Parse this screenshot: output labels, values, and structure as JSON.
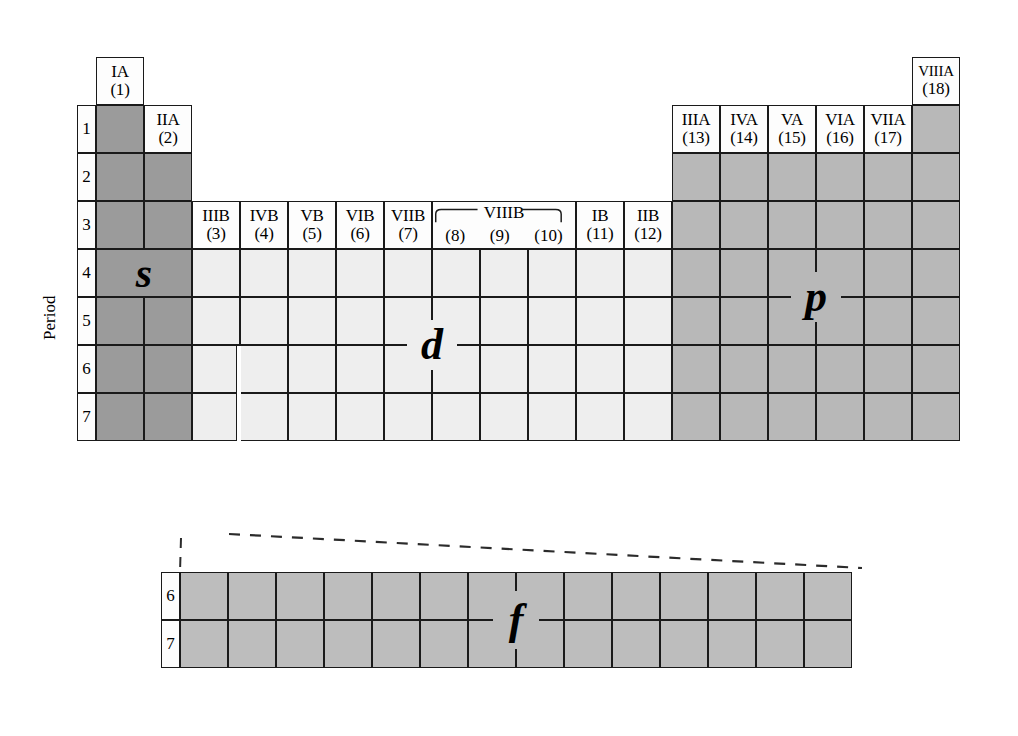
{
  "figure": {
    "kind": "periodic-table-block-diagram",
    "period_axis_label": "Period",
    "period_labels": [
      "1",
      "2",
      "3",
      "4",
      "5",
      "6",
      "7"
    ],
    "f_block_period_labels": [
      "6",
      "7"
    ],
    "block_letters": {
      "s": "s",
      "p": "p",
      "d": "d",
      "f": "f"
    },
    "colors": {
      "s_block": "#9b9b9b",
      "d_block": "#eeeeee",
      "p_block": "#b8b8b8",
      "f_block": "#bdbdbd",
      "header_box": "#fdfdfd",
      "line": "#1a1a1a"
    }
  },
  "group_headers": [
    {
      "roman": "IA",
      "arabic": "(1)",
      "col": 1
    },
    {
      "roman": "IIA",
      "arabic": "(2)",
      "col": 2
    },
    {
      "roman": "IIIB",
      "arabic": "(3)",
      "col": 3
    },
    {
      "roman": "IVB",
      "arabic": "(4)",
      "col": 4
    },
    {
      "roman": "VB",
      "arabic": "(5)",
      "col": 5
    },
    {
      "roman": "VIB",
      "arabic": "(6)",
      "col": 6
    },
    {
      "roman": "VIIB",
      "arabic": "(7)",
      "col": 7
    },
    {
      "roman": "IB",
      "arabic": "(11)",
      "col": 11
    },
    {
      "roman": "IIB",
      "arabic": "(12)",
      "col": 12
    },
    {
      "roman": "IIIA",
      "arabic": "(13)",
      "col": 13
    },
    {
      "roman": "IVA",
      "arabic": "(14)",
      "col": 14
    },
    {
      "roman": "VA",
      "arabic": "(15)",
      "col": 15
    },
    {
      "roman": "VIA",
      "arabic": "(16)",
      "col": 16
    },
    {
      "roman": "VIIA",
      "arabic": "(17)",
      "col": 17
    },
    {
      "roman": "VIIIA",
      "arabic": "(18)",
      "col": 18
    }
  ],
  "group_header_span": {
    "roman": "VIIIB",
    "arabic": [
      "(8)",
      "(9)",
      "(10)"
    ],
    "cols": [
      8,
      9,
      10
    ]
  }
}
